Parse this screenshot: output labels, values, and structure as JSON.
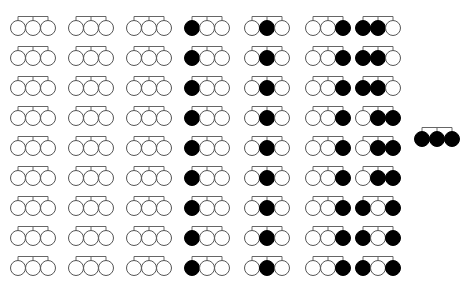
{
  "diagram": {
    "colors": {
      "filled": "#000000",
      "empty": "#ffffff",
      "stroke": "#555555",
      "bracket": "#666666"
    },
    "circle_radius": 7.5,
    "circle_spacing": 15,
    "columns": [
      {
        "x": 18,
        "pattern": "WWW",
        "rows": 9
      },
      {
        "x": 76,
        "pattern": "WWW",
        "rows": 9
      },
      {
        "x": 134,
        "pattern": "WWW",
        "rows": 9
      },
      {
        "x": 192,
        "pattern": "BWW",
        "rows": 9
      },
      {
        "x": 252,
        "pattern": "WBW",
        "rows": 9
      },
      {
        "x": 313,
        "pattern": "WWB",
        "rows": 9
      },
      {
        "x": 363,
        "patterns": [
          "BBW",
          "BBW",
          "BBW",
          "WBB",
          "WBB",
          "WBB",
          "BWB",
          "BWB",
          "BWB"
        ]
      }
    ],
    "row_y": [
      28,
      58,
      88,
      118,
      148,
      178,
      208,
      238,
      268
    ],
    "extra_groups": [
      {
        "x": 422,
        "y": 139,
        "pattern": "BBB"
      }
    ]
  }
}
